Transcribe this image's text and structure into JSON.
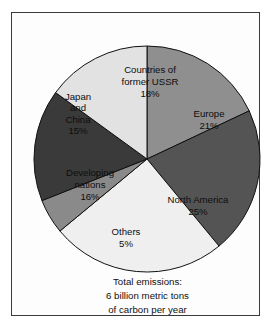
{
  "chart_data": {
    "type": "pie",
    "title": "",
    "units": "percent of total carbon emissions",
    "start_angle_deg": 0,
    "direction": "clockwise",
    "categories": [
      "Countries of former USSR",
      "Europe",
      "North America",
      "Others",
      "Developing nations",
      "Japan and China"
    ],
    "values": [
      18,
      21,
      25,
      5,
      16,
      15
    ],
    "total_percent": 100,
    "legend": "none (labels placed inside slices)",
    "grid": false,
    "slices": [
      {
        "name": "Countries of former USSR",
        "label_lines": [
          "Countries of",
          "former USSR"
        ],
        "percent_label": "18%",
        "value": 18,
        "color": "#8f8f8f",
        "label_x": 138,
        "label_y": 72
      },
      {
        "name": "Europe",
        "label_lines": [
          "Europe"
        ],
        "percent_label": "21%",
        "value": 21,
        "color": "#545454",
        "label_x": 197,
        "label_y": 110
      },
      {
        "name": "North America",
        "label_lines": [
          "North America"
        ],
        "percent_label": "25%",
        "value": 25,
        "color": "#efefef",
        "label_x": 186,
        "label_y": 196
      },
      {
        "name": "Others",
        "label_lines": [
          "Others"
        ],
        "percent_label": "5%",
        "value": 5,
        "color": "#8a8a8a",
        "label_x": 114,
        "label_y": 228
      },
      {
        "name": "Developing nations",
        "label_lines": [
          "Developing",
          "nations"
        ],
        "percent_label": "16%",
        "value": 16,
        "color": "#3a3a3a",
        "label_x": 78,
        "label_y": 175
      },
      {
        "name": "Japan and China",
        "label_lines": [
          "Japan",
          "and",
          "China"
        ],
        "percent_label": "15%",
        "value": 15,
        "color": "#e2e2e2",
        "label_x": 66,
        "label_y": 104
      }
    ]
  },
  "caption": {
    "line1": "Total emissions:",
    "line2": "6 billion metric tons",
    "line3": "of carbon per year"
  },
  "colors": {
    "frame": "#3b3b3b",
    "page_background": "#ffffff",
    "slice_outline": "#111111"
  }
}
